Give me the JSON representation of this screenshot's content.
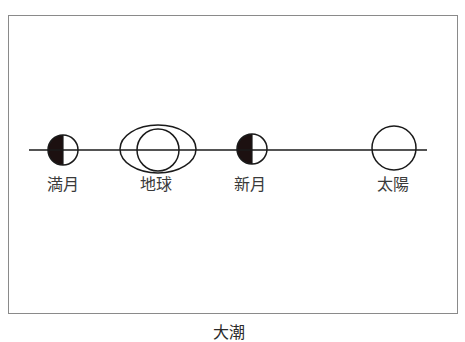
{
  "diagram": {
    "caption": "大潮",
    "colors": {
      "stroke": "#1a1a1a",
      "fill_dark": "#1c1010",
      "frame": "#8a8a8a"
    },
    "axis_line": {
      "x1": 29,
      "x2": 427,
      "y": 150
    },
    "bodies": [
      {
        "id": "full-moon",
        "label": "満月",
        "shape": "half-filled-circle",
        "cx": 63,
        "cy": 150,
        "r": 15
      },
      {
        "id": "earth",
        "label": "地球",
        "shape": "circle-in-ellipse",
        "cx": 158,
        "cy": 149,
        "rx": 38,
        "ry": 24,
        "r": 21
      },
      {
        "id": "new-moon",
        "label": "新月",
        "shape": "half-filled-circle",
        "cx": 252,
        "cy": 149,
        "r": 15
      },
      {
        "id": "sun",
        "label": "太陽",
        "shape": "circle",
        "cx": 394,
        "cy": 148,
        "r": 22
      }
    ]
  }
}
